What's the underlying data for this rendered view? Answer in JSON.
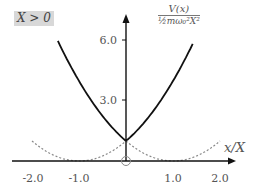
{
  "badge": {
    "text": "X > 0",
    "background": "#d8d8d8"
  },
  "ylabel": {
    "numerator": "V(x)",
    "denominator": "½mω₀²X²"
  },
  "xlabel": "x/X",
  "chart_data": {
    "type": "line",
    "title": "",
    "annotation": "X > 0",
    "xlabel": "x/X",
    "ylabel": "V(x) / (½ m ω₀² X²)",
    "xlim": [
      -2.3,
      2.2
    ],
    "ylim": [
      0,
      6.8
    ],
    "grid": false,
    "legend": null,
    "x_ticks": [
      "-2.0",
      "-1.0",
      "1.0",
      "2.0"
    ],
    "y_ticks": [
      "3.0",
      "6.0"
    ],
    "series": [
      {
        "name": "V(x) (solid)",
        "style": "solid",
        "color": "#1a1a1a",
        "x": [
          -1.45,
          -1.0,
          -0.5,
          0.0,
          0.5,
          1.0,
          1.4
        ],
        "y": [
          6.0,
          4.0,
          2.25,
          1.0,
          2.25,
          4.0,
          5.76
        ]
      },
      {
        "name": "(x+1)^2 (dashed, left)",
        "style": "dashed",
        "color": "#888888",
        "x": [
          -2.0,
          -1.5,
          -1.0,
          -0.5,
          0.0,
          0.5
        ],
        "y": [
          1.0,
          0.25,
          0.0,
          0.25,
          1.0,
          2.25
        ]
      },
      {
        "name": "(x-1)^2 (dashed, right)",
        "style": "dashed",
        "color": "#888888",
        "x": [
          -0.5,
          0.0,
          0.5,
          1.0,
          1.5,
          2.0
        ],
        "y": [
          2.25,
          1.0,
          0.25,
          0.0,
          0.25,
          1.0
        ]
      }
    ],
    "markers": [
      {
        "x": 0,
        "y": 0,
        "shape": "open-circle"
      }
    ]
  }
}
